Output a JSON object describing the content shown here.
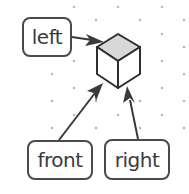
{
  "diagram": {
    "type": "isometric cube orientation labels",
    "labels": [
      {
        "id": "left",
        "text": "left"
      },
      {
        "id": "front",
        "text": "front"
      },
      {
        "id": "right",
        "text": "right"
      }
    ],
    "colors": {
      "stroke": "#2e2e2e",
      "top_face": "#d8d8d8",
      "grid_dot": "#b8b8b8",
      "label_border": "#4a4a4a"
    }
  }
}
